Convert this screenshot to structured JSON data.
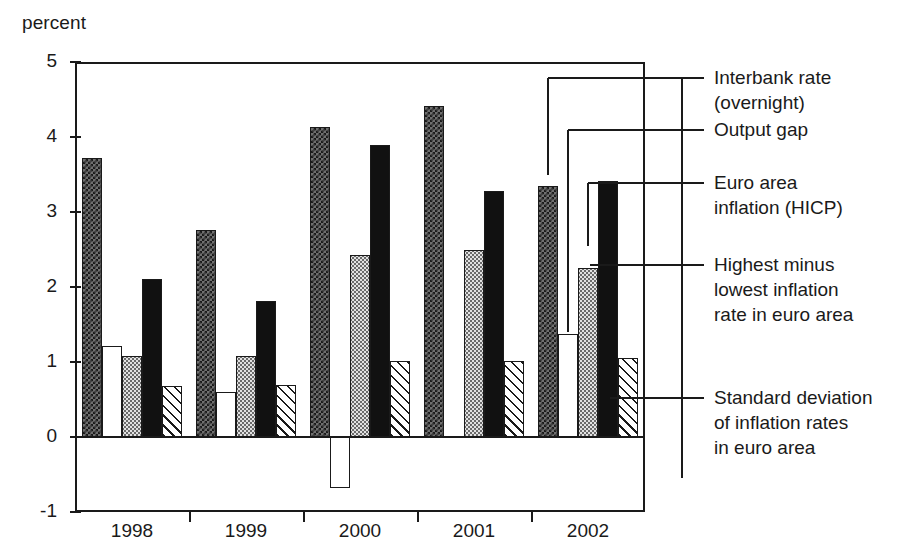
{
  "axis_title": "percent",
  "chart_data": {
    "type": "bar",
    "title": "",
    "subtitle": "",
    "xlabel": "",
    "ylabel": "percent",
    "ylim": [
      -1,
      5
    ],
    "yticks": [
      5,
      4,
      3,
      2,
      1,
      0,
      -1
    ],
    "ytick_labels": [
      "5",
      "4",
      "3",
      "2",
      "1",
      "0",
      "-1"
    ],
    "grid": false,
    "legend_position": "right",
    "categories": [
      "1998",
      "1999",
      "2000",
      "2001",
      "2002"
    ],
    "series": [
      {
        "name": "Interbank rate (overnight)",
        "pattern": "checker",
        "values": [
          3.72,
          2.76,
          4.14,
          4.41,
          3.35
        ]
      },
      {
        "name": "Output gap",
        "pattern": "white",
        "values": [
          1.21,
          0.6,
          -0.68,
          0.0,
          1.37
        ]
      },
      {
        "name": "Euro area inflation (HICP)",
        "pattern": "dots",
        "values": [
          1.08,
          1.08,
          2.43,
          2.49,
          2.25
        ]
      },
      {
        "name": "Highest minus lowest inflation rate in euro area",
        "pattern": "solid",
        "values": [
          2.11,
          1.82,
          3.9,
          3.28,
          3.42
        ]
      },
      {
        "name": "Standard deviation of inflation rates in euro area",
        "pattern": "hatch",
        "values": [
          0.68,
          0.69,
          1.02,
          1.02,
          1.05
        ]
      }
    ]
  },
  "legend": {
    "items": [
      {
        "line1": "Interbank rate",
        "line2": "(overnight)",
        "line3": ""
      },
      {
        "line1": "Output gap",
        "line2": "",
        "line3": ""
      },
      {
        "line1": "Euro area",
        "line2": "inflation (HICP)",
        "line3": ""
      },
      {
        "line1": "Highest minus",
        "line2": "lowest inflation",
        "line3": "rate in euro area"
      },
      {
        "line1": "Standard deviation",
        "line2": "of inflation rates",
        "line3": "in euro area"
      }
    ]
  },
  "colors": {
    "ink": "#1a1a1a",
    "background": "#ffffff",
    "series_solid": "#111111",
    "series_gray": "#6f6f6f",
    "series_light": "#e2e2e2"
  }
}
